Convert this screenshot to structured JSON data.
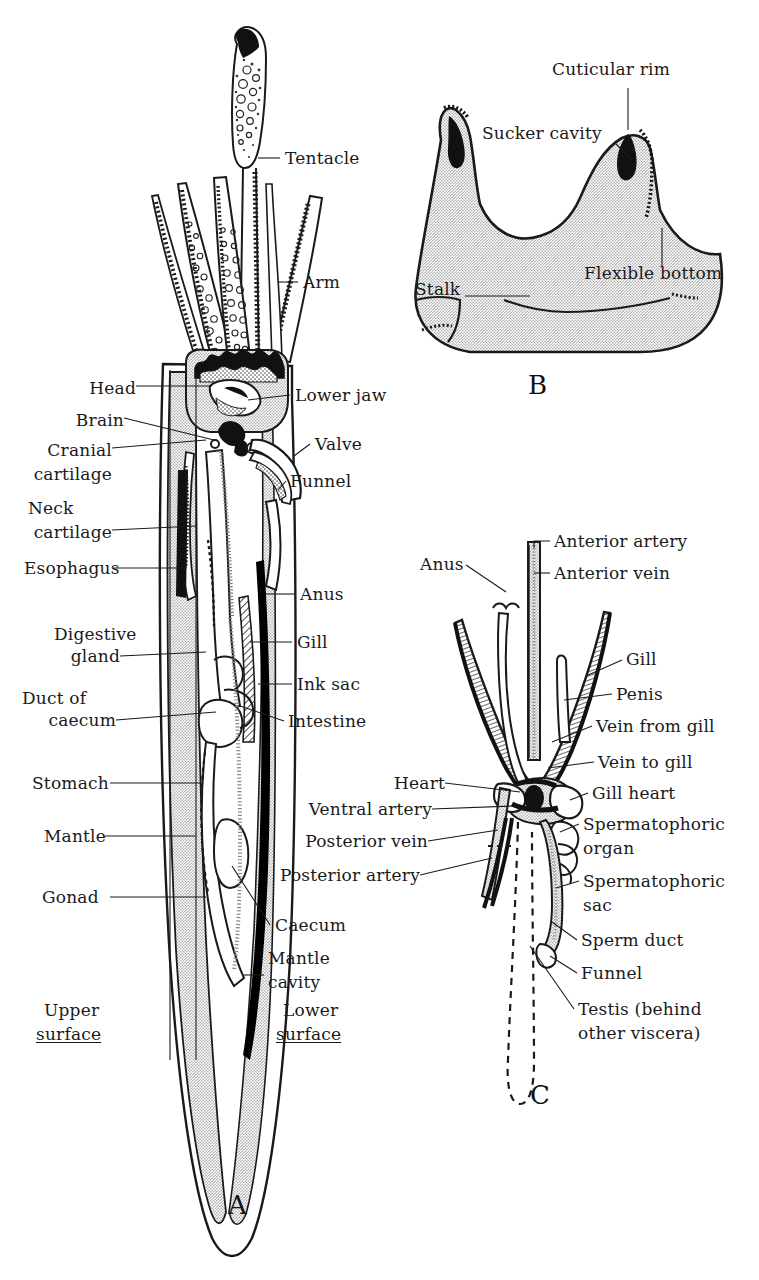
{
  "figure": {
    "ink": "#1a1a1a",
    "tissue_fill": "#c8c8c8",
    "dark_fill": "#000000",
    "paper": "#ffffff"
  },
  "panels": {
    "a": {
      "letter": "A",
      "labels_left": [
        {
          "text": "Head",
          "x": 88,
          "y": 390
        },
        {
          "text": "Brain",
          "x": 75,
          "y": 422
        },
        {
          "text": "Cranial",
          "x": 36,
          "y": 452
        },
        {
          "text": "cartilage",
          "x": 30,
          "y": 476
        },
        {
          "text": "Neck",
          "x": 30,
          "y": 510
        },
        {
          "text": "cartilage",
          "x": 30,
          "y": 534
        },
        {
          "text": "Esophagus",
          "x": 24,
          "y": 572
        },
        {
          "text": "Digestive",
          "x": 56,
          "y": 636
        },
        {
          "text": "gland",
          "x": 66,
          "y": 660
        },
        {
          "text": "Duct of",
          "x": 22,
          "y": 700
        },
        {
          "text": "caecum",
          "x": 32,
          "y": 724
        },
        {
          "text": "Stomach",
          "x": 32,
          "y": 787
        },
        {
          "text": "Mantle",
          "x": 44,
          "y": 840
        },
        {
          "text": "Gonad",
          "x": 42,
          "y": 901
        },
        {
          "text": "Upper",
          "x": 44,
          "y": 1014
        },
        {
          "text": "surface",
          "x": 36,
          "y": 1038
        }
      ],
      "labels_right": [
        {
          "text": "Tentacle",
          "x": 285,
          "y": 162
        },
        {
          "text": "Arm",
          "x": 303,
          "y": 286
        },
        {
          "text": "Lower jaw",
          "x": 295,
          "y": 399
        },
        {
          "text": "Valve",
          "x": 315,
          "y": 448
        },
        {
          "text": "Funnel",
          "x": 290,
          "y": 485
        },
        {
          "text": "Anus",
          "x": 300,
          "y": 598
        },
        {
          "text": "Gill",
          "x": 297,
          "y": 646
        },
        {
          "text": "Ink sac",
          "x": 297,
          "y": 688
        },
        {
          "text": "Intestine",
          "x": 288,
          "y": 725
        },
        {
          "text": "Caecum",
          "x": 275,
          "y": 929
        },
        {
          "text": "Mantle",
          "x": 268,
          "y": 962
        },
        {
          "text": "cavity",
          "x": 268,
          "y": 986
        },
        {
          "text": "Lower",
          "x": 283,
          "y": 1014
        },
        {
          "text": "surface",
          "x": 276,
          "y": 1038
        }
      ],
      "underlined": [
        "surface"
      ]
    },
    "b": {
      "letter": "B",
      "labels": [
        {
          "text": "Cuticular rim",
          "x": 552,
          "y": 73
        },
        {
          "text": "Sucker cavity",
          "x": 482,
          "y": 137
        },
        {
          "text": "Flexible bottom",
          "x": 584,
          "y": 277
        },
        {
          "text": "Stalk",
          "x": 421,
          "y": 293
        }
      ]
    },
    "c": {
      "letter": "C",
      "labels": [
        {
          "text": "Anus",
          "x": 423,
          "y": 568
        },
        {
          "text": "Anterior artery",
          "x": 556,
          "y": 545
        },
        {
          "text": "Anterior vein",
          "x": 556,
          "y": 577
        },
        {
          "text": "Gill",
          "x": 627,
          "y": 663
        },
        {
          "text": "Penis",
          "x": 618,
          "y": 698
        },
        {
          "text": "Vein from gill",
          "x": 598,
          "y": 730
        },
        {
          "text": "Vein to gill",
          "x": 600,
          "y": 766
        },
        {
          "text": "Heart",
          "x": 405,
          "y": 787
        },
        {
          "text": "Ventral artery",
          "x": 324,
          "y": 813
        },
        {
          "text": "Posterior vein",
          "x": 322,
          "y": 845
        },
        {
          "text": "Posterior artery",
          "x": 300,
          "y": 879
        },
        {
          "text": "Gill heart",
          "x": 594,
          "y": 797
        },
        {
          "text": "Spermatophoric",
          "x": 585,
          "y": 828
        },
        {
          "text": "organ",
          "x": 585,
          "y": 852
        },
        {
          "text": "Spermatophoric",
          "x": 585,
          "y": 885
        },
        {
          "text": "sac",
          "x": 585,
          "y": 909
        },
        {
          "text": "Sperm duct",
          "x": 583,
          "y": 944
        },
        {
          "text": "Funnel",
          "x": 583,
          "y": 977
        },
        {
          "text": "Testis (behind",
          "x": 580,
          "y": 1013
        },
        {
          "text": "other viscera)",
          "x": 580,
          "y": 1037
        }
      ]
    }
  }
}
